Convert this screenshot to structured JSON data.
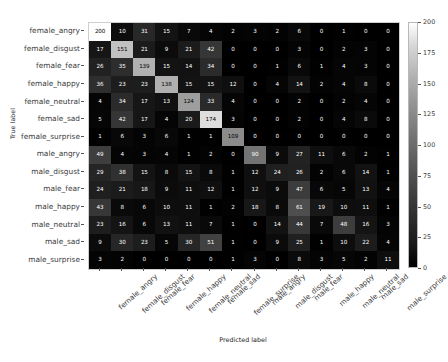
{
  "chart_data": {
    "type": "heatmap",
    "subtype": "confusion-matrix",
    "title": "",
    "xlabel": "Predicted label",
    "ylabel": "True label",
    "colormap": "gray",
    "grid": false,
    "legend_position": "right",
    "colorbar": {
      "vmin": 0,
      "vmax": 200,
      "ticks": [
        0,
        25,
        50,
        75,
        100,
        125,
        150,
        175,
        200
      ],
      "tick_labels": [
        "0",
        "25",
        "50",
        "75",
        "100",
        "125",
        "150",
        "175",
        "200"
      ]
    },
    "categories": [
      "female_angry",
      "female_disgust",
      "female_fear",
      "female_happy",
      "female_neutral",
      "female_sad",
      "female_surprise",
      "male_angry",
      "male_disgust",
      "male_fear",
      "male_happy",
      "male_neutral",
      "male_sad",
      "male_surprise"
    ],
    "x_categories": [
      "female_angry",
      "female_disgust",
      "female_fear",
      "female_happy",
      "female_neutral",
      "female_sad",
      "female_surprise",
      "male_angry",
      "male_disgust",
      "male_fear",
      "male_happy",
      "male_neutral",
      "male_sad",
      "male_surprise"
    ],
    "y_categories": [
      "female_angry",
      "female_disgust",
      "female_fear",
      "female_happy",
      "female_neutral",
      "female_sad",
      "female_surprise",
      "male_angry",
      "male_disgust",
      "male_fear",
      "male_happy",
      "male_neutral",
      "male_sad",
      "male_surprise"
    ],
    "matrix": [
      [
        200,
        10,
        31,
        15,
        7,
        4,
        2,
        3,
        2,
        6,
        0,
        1,
        0,
        0
      ],
      [
        17,
        151,
        21,
        9,
        21,
        42,
        0,
        0,
        0,
        3,
        0,
        2,
        3,
        0
      ],
      [
        26,
        35,
        139,
        15,
        14,
        34,
        0,
        0,
        1,
        6,
        1,
        4,
        3,
        0
      ],
      [
        36,
        23,
        23,
        138,
        15,
        15,
        12,
        0,
        4,
        14,
        2,
        4,
        8,
        0
      ],
      [
        4,
        34,
        17,
        13,
        124,
        33,
        4,
        0,
        0,
        2,
        0,
        2,
        4,
        0
      ],
      [
        5,
        42,
        17,
        4,
        20,
        174,
        3,
        0,
        0,
        2,
        0,
        4,
        8,
        0
      ],
      [
        1,
        6,
        3,
        6,
        1,
        1,
        109,
        0,
        0,
        0,
        0,
        0,
        0,
        0
      ],
      [
        49,
        4,
        3,
        4,
        1,
        2,
        0,
        90,
        9,
        27,
        11,
        6,
        2,
        1
      ],
      [
        29,
        38,
        15,
        8,
        15,
        8,
        1,
        12,
        24,
        26,
        2,
        6,
        14,
        1
      ],
      [
        24,
        21,
        18,
        9,
        11,
        12,
        1,
        12,
        9,
        47,
        6,
        5,
        13,
        4
      ],
      [
        43,
        8,
        6,
        10,
        11,
        1,
        2,
        18,
        8,
        61,
        19,
        10,
        11,
        1
      ],
      [
        23,
        16,
        6,
        13,
        11,
        7,
        1,
        0,
        14,
        44,
        7,
        48,
        16,
        3
      ],
      [
        9,
        30,
        23,
        5,
        30,
        51,
        1,
        0,
        9,
        25,
        1,
        10,
        22,
        4
      ],
      [
        3,
        2,
        0,
        0,
        0,
        0,
        1,
        3,
        0,
        8,
        3,
        5,
        2,
        11
      ]
    ]
  },
  "caption": {
    "text": ""
  }
}
